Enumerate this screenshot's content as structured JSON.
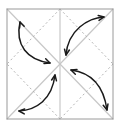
{
  "canvas": {
    "width": 120,
    "height": 128,
    "background": "#ffffff",
    "title": "origami-fold-diagram"
  },
  "colors": {
    "frame": "#9a9a9a",
    "crease_solid": "#c8c8c8",
    "crease_dashed": "#b4b4b4",
    "arrow": "#1a1a1a",
    "background": "#ffffff"
  },
  "diagram": {
    "type": "origami-fold-instruction",
    "frame": {
      "name": "paper-square",
      "x": 7,
      "y": 9,
      "width": 106,
      "height": 110,
      "stroke": "#9a9a9a",
      "stroke_width": 1,
      "fill": "#ffffff"
    },
    "center": {
      "x": 60,
      "y": 64
    },
    "solid_creases": [
      {
        "name": "diagonal-tl-br",
        "x1": 7,
        "y1": 9,
        "x2": 113,
        "y2": 119
      },
      {
        "name": "diagonal-tr-bl",
        "x1": 113,
        "y1": 9,
        "x2": 7,
        "y2": 119
      },
      {
        "name": "vertical-center",
        "x1": 60,
        "y1": 9,
        "x2": 60,
        "y2": 119
      }
    ],
    "dashed_creases": [
      {
        "name": "diamond-edge-top-left",
        "x1": 60,
        "y1": 9,
        "x2": 7,
        "y2": 64
      },
      {
        "name": "diamond-edge-top-right",
        "x1": 60,
        "y1": 9,
        "x2": 113,
        "y2": 64
      },
      {
        "name": "diamond-edge-bottom-right",
        "x1": 113,
        "y1": 64,
        "x2": 60,
        "y2": 119
      },
      {
        "name": "diamond-edge-bottom-left",
        "x1": 60,
        "y1": 119,
        "x2": 7,
        "y2": 64
      }
    ],
    "dash_pattern": "2,2.6",
    "arrows": [
      {
        "name": "fold-arrow-upper-left",
        "path": "M 20,22 C 15,45 27,60 50,63",
        "head_start": {
          "x": 20,
          "y": 22,
          "angle": 250
        },
        "head_end": {
          "x": 50,
          "y": 63,
          "angle": 20
        },
        "double_headed": true
      },
      {
        "name": "fold-arrow-upper-right",
        "path": "M 66,55 C 68,30 88,18 104,17",
        "head_start": {
          "x": 66,
          "y": 55,
          "angle": 100
        },
        "head_end": {
          "x": 104,
          "y": 17,
          "angle": -10
        },
        "double_headed": true
      },
      {
        "name": "fold-arrow-lower-right",
        "path": "M 71,70 C 94,73 104,88 107,110",
        "head_start": {
          "x": 71,
          "y": 70,
          "angle": 200
        },
        "head_end": {
          "x": 107,
          "y": 110,
          "angle": 75
        },
        "double_headed": true
      },
      {
        "name": "fold-arrow-lower-left",
        "path": "M 55,75 C 52,100 36,110 19,111",
        "head_start": {
          "x": 55,
          "y": 75,
          "angle": 280
        },
        "head_end": {
          "x": 19,
          "y": 111,
          "angle": 185
        },
        "double_headed": true
      }
    ],
    "arrow_stroke_width": 1.5,
    "arrowhead_size": 6
  }
}
